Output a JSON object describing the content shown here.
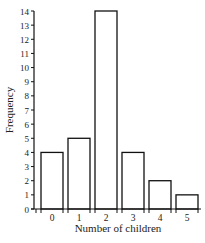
{
  "chart_data": {
    "type": "bar",
    "title": "",
    "xlabel": "Number of children",
    "ylabel": "Frequency",
    "categories": [
      "0",
      "1",
      "2",
      "3",
      "4",
      "5"
    ],
    "values": [
      4,
      5,
      14,
      4,
      2,
      1
    ],
    "ylim": [
      0,
      14
    ],
    "yticks": [
      0,
      1,
      2,
      3,
      4,
      5,
      6,
      7,
      8,
      9,
      10,
      11,
      12,
      13,
      14
    ],
    "grid": false,
    "legend": null,
    "bar_fill": "#ffffff",
    "bar_stroke": "#111111"
  }
}
